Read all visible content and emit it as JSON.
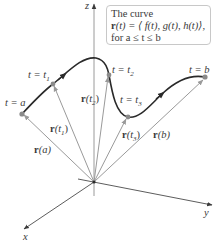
{
  "info_box": {
    "line1": "The curve",
    "line2_bold": "r",
    "line2_rest": "(t) = ⟨ f(t), g(t), h(t)⟩,",
    "line3": "for a ≤ t ≤ b"
  },
  "axes": {
    "z_label": "z",
    "y_label": "y",
    "x_label": "x"
  },
  "points": [
    {
      "label": "t = a",
      "name": "a"
    },
    {
      "label": "t = t",
      "sub": "1",
      "name": "t1"
    },
    {
      "label": "t = t",
      "sub": "2",
      "name": "t2"
    },
    {
      "label": "t = t",
      "sub": "3",
      "name": "t3"
    },
    {
      "label": "t = b",
      "name": "b"
    }
  ],
  "vectors": [
    {
      "bold": "r",
      "arg": "(a)",
      "name": "r-a"
    },
    {
      "bold": "r",
      "arg": "(t",
      "sub": "1",
      "close": ")",
      "name": "r-t1"
    },
    {
      "bold": "r",
      "arg": "(t",
      "sub": "2",
      "close": ")",
      "name": "r-t2"
    },
    {
      "bold": "r",
      "arg": "(t",
      "sub": "3",
      "close": ")",
      "name": "r-t3"
    },
    {
      "bold": "r",
      "arg": "(b)",
      "name": "r-b"
    }
  ],
  "colors": {
    "curve": "#2a2a2a",
    "vector": "#9a9a9a",
    "axis": "#4a4a4a",
    "point": "#8a8a8a"
  }
}
